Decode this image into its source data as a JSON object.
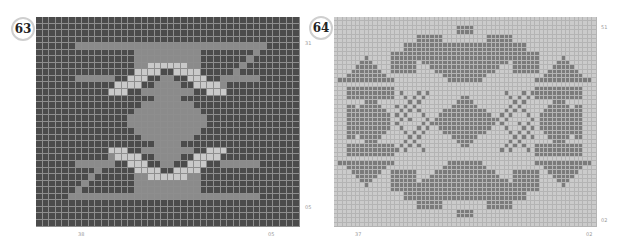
{
  "charts": [
    {
      "id": "63",
      "badge": "63",
      "cols": 40,
      "rows": 32,
      "cell_w": 6.6,
      "cell_h": 6.55,
      "left": 36,
      "top": 17,
      "line_color": "#8e8e8e",
      "palette": {
        "D": "#4b4b4b",
        "M": "#8b8b8b",
        "L": "#c9c9c9"
      },
      "half_rows": [
        "DDDDDDDDDDDDDDDDDDDD",
        "DDDDDDDDDDDDDDDDDDDD",
        "DDDDDDDDDDDDDDDDDDDD",
        "DDDDDDDDDDDDDDDDDDDD",
        "DDDDDDDDDDDDDDDDDDDD",
        "DDDDDDDDDDDDDDDDDDDD",
        "DDDDDDDDDDDDDDDDDDDD",
        "DDDDDDDDDDDDDDDDDDDD",
        "DDDDDDDDDDDDDDDDDDDD",
        "DDDDDDDDDDDDDDDDDDDD",
        "DDDDDDDDDDDDDDDDDDDD",
        "DDDDDDDDDDDDDDDDDDDD",
        "DDDDDDDDDDDDDDDDDDDD",
        "DDDDDDDDDDDDDDDDDDDD",
        "DDDDDDDDDDDDDDDDDDDD",
        "DDDDDDDDDDDDDDDDDDDD"
      ],
      "shapes_note": "pattern generated procedurally in script from shape rules",
      "labels": [
        {
          "text": "31",
          "x": 305,
          "y": 40
        },
        {
          "text": "05",
          "x": 305,
          "y": 204
        },
        {
          "text": "38",
          "x": 78,
          "y": 231
        },
        {
          "text": "05",
          "x": 268,
          "y": 231
        }
      ]
    },
    {
      "id": "64",
      "badge": "64",
      "cols": 60,
      "rows": 48,
      "cell_w": 4.38,
      "cell_h": 4.38,
      "left": 334,
      "top": 17,
      "line_color": "#b4b4b4",
      "palette": {
        "L": "#cbcbcb",
        "D": "#7b7b7b"
      },
      "labels": [
        {
          "text": "51",
          "x": 601,
          "y": 24
        },
        {
          "text": "02",
          "x": 601,
          "y": 217
        },
        {
          "text": "37",
          "x": 355,
          "y": 231
        },
        {
          "text": "02",
          "x": 586,
          "y": 231
        }
      ]
    }
  ]
}
